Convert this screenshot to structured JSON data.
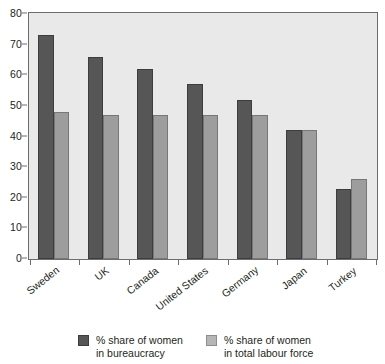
{
  "chart_data": {
    "type": "bar",
    "title": "",
    "subtitle": "",
    "xlabel": "",
    "ylabel": "",
    "ylim": [
      0,
      80
    ],
    "yticks": [
      0,
      10,
      20,
      30,
      40,
      50,
      60,
      70,
      80
    ],
    "grid": false,
    "legend_position": "bottom",
    "categories": [
      "Sweden",
      "UK",
      "Canada",
      "United States",
      "Germany",
      "Japan",
      "Turkey"
    ],
    "series": [
      {
        "name": "% share of women in bureaucracy",
        "name_line1": "% share of women",
        "name_line2": "in bureaucracy",
        "color": "#565656",
        "values": [
          73,
          66,
          62,
          57,
          52,
          42,
          23
        ]
      },
      {
        "name": "% share of women in total labour force",
        "name_line1": "% share of women",
        "name_line2": "in total labour force",
        "color": "#9d9d9d",
        "values": [
          48,
          47,
          47,
          47,
          47,
          42,
          26
        ]
      }
    ]
  },
  "style": {
    "plot_background": "#e9e9e9",
    "axis_color": "#6d6d6d",
    "text_color": "#231f20",
    "page_background": "#ffffff"
  }
}
